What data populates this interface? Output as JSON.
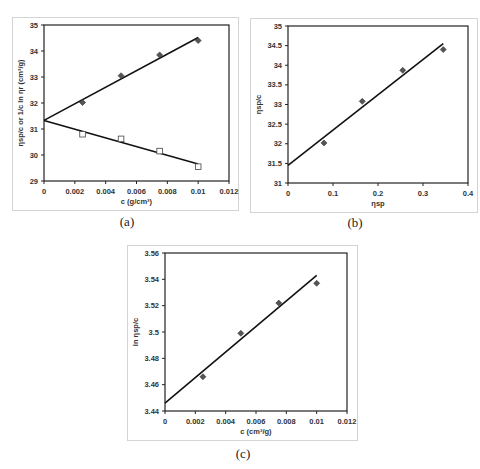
{
  "chart_data": [
    {
      "id": "a",
      "type": "scatter",
      "caption": "(a)",
      "title": "",
      "xlabel": "c (g/cm³)",
      "ylabel": "ηsp/c or 1/c ln ηr (cm³/g)",
      "xlim": [
        0,
        0.012
      ],
      "ylim": [
        29,
        35
      ],
      "xticks": [
        "0",
        "0.002",
        "0.004",
        "0.006",
        "0.008",
        "0.01",
        "0.012"
      ],
      "xtick_values": [
        0,
        0.002,
        0.004,
        0.006,
        0.008,
        0.01,
        0.012
      ],
      "yticks": [
        "29",
        "30",
        "31",
        "32",
        "33",
        "34",
        "35"
      ],
      "ytick_values": [
        29,
        30,
        31,
        32,
        33,
        34,
        35
      ],
      "grid": false,
      "legend": "none",
      "series": [
        {
          "name": "ηsp/c",
          "marker": "diamond",
          "x": [
            0.0025,
            0.005,
            0.0075,
            0.01
          ],
          "y": [
            32.02,
            33.05,
            33.85,
            34.4
          ],
          "fit": {
            "x": [
              0,
              0.01
            ],
            "y": [
              31.33,
              34.52
            ]
          }
        },
        {
          "name": "1/c ln ηr",
          "marker": "square-open",
          "x": [
            0.0025,
            0.005,
            0.0075,
            0.01
          ],
          "y": [
            30.8,
            30.62,
            30.15,
            29.55
          ],
          "fit": {
            "x": [
              0,
              0.01
            ],
            "y": [
              31.33,
              29.65
            ]
          }
        }
      ]
    },
    {
      "id": "b",
      "type": "scatter",
      "caption": "(b)",
      "title": "",
      "xlabel": "ηsp",
      "ylabel": "ηsp/c",
      "xlim": [
        0,
        0.4
      ],
      "ylim": [
        31,
        35
      ],
      "xticks": [
        "0",
        "0.1",
        "0.2",
        "0.3",
        "0.4"
      ],
      "xtick_values": [
        0,
        0.1,
        0.2,
        0.3,
        0.4
      ],
      "yticks": [
        "31",
        "31.5",
        "32",
        "32.5",
        "33",
        "33.5",
        "34",
        "34.5",
        "35"
      ],
      "ytick_values": [
        31,
        31.5,
        32,
        32.5,
        33,
        33.5,
        34,
        34.5,
        35
      ],
      "grid": false,
      "legend": "none",
      "series": [
        {
          "name": "ηsp/c",
          "marker": "diamond",
          "x": [
            0.08,
            0.165,
            0.255,
            0.345
          ],
          "y": [
            32.02,
            33.08,
            33.87,
            34.4
          ],
          "fit": {
            "x": [
              0,
              0.345
            ],
            "y": [
              31.45,
              34.55
            ]
          }
        }
      ]
    },
    {
      "id": "c",
      "type": "scatter",
      "caption": "(c)",
      "title": "",
      "xlabel": "c (cm³/g)",
      "ylabel": "ln ηsp/c",
      "xlim": [
        0,
        0.012
      ],
      "ylim": [
        3.44,
        3.56
      ],
      "xticks": [
        "0",
        "0.002",
        "0.004",
        "0.006",
        "0.008",
        "0.01",
        "0.012"
      ],
      "xtick_values": [
        0,
        0.002,
        0.004,
        0.006,
        0.008,
        0.01,
        0.012
      ],
      "yticks": [
        "3.44",
        "3.46",
        "3.48",
        "3.5",
        "3.52",
        "3.54",
        "3.56"
      ],
      "ytick_values": [
        3.44,
        3.46,
        3.48,
        3.5,
        3.52,
        3.54,
        3.56
      ],
      "grid": false,
      "legend": "none",
      "series": [
        {
          "name": "ln ηsp/c",
          "marker": "diamond",
          "x": [
            0.0025,
            0.005,
            0.0075,
            0.01
          ],
          "y": [
            3.466,
            3.499,
            3.522,
            3.537
          ],
          "fit": {
            "x": [
              0,
              0.01
            ],
            "y": [
              3.446,
              3.543
            ]
          }
        }
      ]
    }
  ],
  "layout": {
    "panels": [
      {
        "frame": [
          12,
          17,
          227,
          194
        ],
        "plot": [
          44,
          25,
          229,
          181
        ],
        "caption_xy": [
          127,
          222
        ]
      },
      {
        "frame": [
          250,
          18,
          228,
          195
        ],
        "plot": [
          288,
          26,
          468,
          183
        ],
        "caption_xy": [
          355,
          223
        ]
      },
      {
        "frame": [
          127,
          245,
          231,
          196
        ],
        "plot": [
          165,
          253,
          347,
          411
        ],
        "caption_xy": [
          243,
          454
        ]
      }
    ]
  }
}
